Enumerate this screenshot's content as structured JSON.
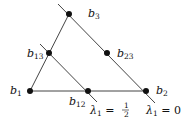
{
  "diagram": {
    "title": "",
    "points": [
      {
        "id": "b1",
        "label": "b",
        "sub": "1",
        "x": 30,
        "y": 91,
        "lx": 10,
        "ly": 94
      },
      {
        "id": "b2",
        "label": "b",
        "sub": "2",
        "x": 146,
        "y": 91,
        "lx": 156,
        "ly": 94
      },
      {
        "id": "b3",
        "label": "b",
        "sub": "3",
        "x": 69,
        "y": 14,
        "lx": 88,
        "ly": 17
      },
      {
        "id": "b12",
        "label": "b",
        "sub": "12",
        "x": 88,
        "y": 91,
        "lx": 69,
        "ly": 105
      },
      {
        "id": "b13",
        "label": "b",
        "sub": "13",
        "x": 49,
        "y": 53,
        "lx": 27,
        "ly": 57
      },
      {
        "id": "b23",
        "label": "b",
        "sub": "23",
        "x": 107,
        "y": 53,
        "lx": 117,
        "ly": 57
      }
    ],
    "lines": [
      {
        "id": "lambda1-0",
        "label": "λ₁ = 0",
        "x1": 58,
        "y1": 4,
        "x2": 155,
        "y2": 103
      },
      {
        "id": "lambda1-half",
        "label": "λ₁ = ½",
        "x1": 40,
        "y1": 44,
        "x2": 97,
        "y2": 102
      }
    ],
    "line_labels": {
      "lambda_half": {
        "lambda": "λ",
        "sub": "1",
        "eq": " = ",
        "num": "1",
        "den": "2"
      },
      "lambda_zero": {
        "lambda": "λ",
        "sub": "1",
        "eq": " = ",
        "val": "0"
      }
    }
  }
}
